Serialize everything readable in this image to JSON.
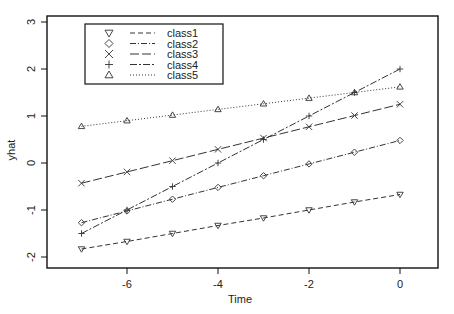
{
  "chart_data": {
    "type": "line",
    "title": "",
    "xlabel": "Time",
    "ylabel": "yhat",
    "xlim": [
      -7.5,
      0.85
    ],
    "ylim": [
      -2.2,
      3.15
    ],
    "x_ticks": [
      -6,
      -4,
      -2,
      0
    ],
    "x_tick_labels": [
      "-6",
      "-4",
      "-2",
      "0"
    ],
    "y_ticks": [
      -2,
      -1,
      0,
      1,
      2,
      3
    ],
    "y_tick_labels": [
      "-2",
      "-1",
      "0",
      "1",
      "2",
      "3"
    ],
    "grid": false,
    "legend_position": "top-left",
    "x": [
      -7,
      -6,
      -5,
      -4,
      -3,
      -2,
      -1,
      0
    ],
    "series": [
      {
        "name": "class1",
        "marker": "triangle-down",
        "line_style": "dashed",
        "values": [
          -1.83,
          -1.67,
          -1.5,
          -1.33,
          -1.17,
          -1.0,
          -0.83,
          -0.67
        ]
      },
      {
        "name": "class2",
        "marker": "diamond",
        "line_style": "dash-dot",
        "values": [
          -1.27,
          -1.02,
          -0.77,
          -0.52,
          -0.27,
          -0.02,
          0.23,
          0.48
        ]
      },
      {
        "name": "class3",
        "marker": "x",
        "line_style": "long-dash",
        "values": [
          -0.43,
          -0.19,
          0.05,
          0.29,
          0.53,
          0.77,
          1.01,
          1.25
        ]
      },
      {
        "name": "class4",
        "marker": "plus",
        "line_style": "dash-dot-long",
        "values": [
          -1.5,
          -1.0,
          -0.5,
          0.0,
          0.5,
          1.0,
          1.5,
          2.0
        ]
      },
      {
        "name": "class5",
        "marker": "triangle-up",
        "line_style": "dotted",
        "values": [
          0.78,
          0.9,
          1.02,
          1.14,
          1.26,
          1.38,
          1.5,
          1.62
        ]
      }
    ]
  },
  "colors": {
    "line": "#333333",
    "axis": "#111111",
    "background": "#ffffff"
  }
}
